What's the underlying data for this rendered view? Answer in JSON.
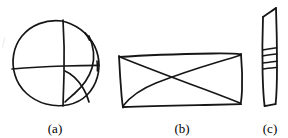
{
  "figure": {
    "background_color": "#ffffff",
    "ink_color": "#161616",
    "width": 288,
    "height": 138,
    "subfigures": [
      {
        "id": "a",
        "caption": "(a)",
        "shape_name": "circle-with-chords-sketch",
        "description": "Freehand circle crossed by a near-vertical chord, a near-horizontal chord, and two curved arcs in the lower-right quadrant"
      },
      {
        "id": "b",
        "caption": "(b)",
        "shape_name": "quadrilateral-with-diagonals-sketch",
        "description": "Freehand wide quadrilateral with both diagonals drawn, crossing left of centre"
      },
      {
        "id": "c",
        "caption": "(c)",
        "shape_name": "banded-strip-sketch",
        "description": "Narrow tall freehand strip with an angled top and three horizontal band lines across the upper-middle"
      }
    ]
  }
}
